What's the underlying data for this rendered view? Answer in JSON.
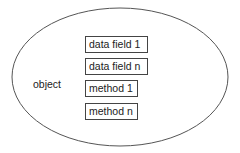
{
  "diagram": {
    "container_label": "object",
    "members": [
      {
        "label": "data field 1",
        "kind": "data field"
      },
      {
        "label": "data field n",
        "kind": "data field"
      },
      {
        "label": "method 1",
        "kind": "method"
      },
      {
        "label": "method n",
        "kind": "method"
      }
    ],
    "colors": {
      "stroke": "#555555",
      "box_border": "#444444",
      "text": "#222222",
      "background": "#ffffff"
    }
  }
}
